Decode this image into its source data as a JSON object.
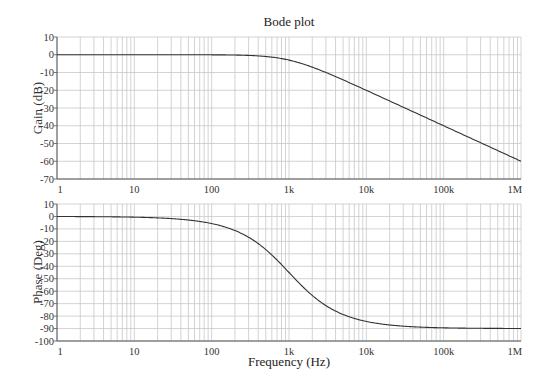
{
  "chart_data": [
    {
      "type": "line",
      "title": "Bode plot",
      "xlabel": "",
      "ylabel": "Gain (dB)",
      "xscale": "log",
      "xlim": [
        1,
        1000000
      ],
      "ylim": [
        -70,
        10
      ],
      "grid": true,
      "x_ticks": [
        "1",
        "10",
        "100",
        "1k",
        "10k",
        "100k",
        "1M"
      ],
      "y_ticks": [
        "10",
        "0",
        "-10",
        "-20",
        "-30",
        "-40",
        "-50",
        "-60",
        "-70"
      ],
      "series": [
        {
          "name": "Gain",
          "x": [
            1,
            10,
            100,
            300,
            1000,
            3000,
            10000,
            100000,
            1000000
          ],
          "y": [
            0,
            0,
            -0.04,
            -0.37,
            -3.01,
            -10.0,
            -20.04,
            -40.0,
            -60.0
          ]
        }
      ]
    },
    {
      "type": "line",
      "title": "",
      "xlabel": "Frequency (Hz)",
      "ylabel": "Phase (Deg)",
      "xscale": "log",
      "xlim": [
        1,
        1000000
      ],
      "ylim": [
        -100,
        10
      ],
      "grid": true,
      "x_ticks": [
        "1",
        "10",
        "100",
        "1k",
        "10k",
        "100k",
        "1M"
      ],
      "y_ticks": [
        "10",
        "0",
        "-10",
        "-20",
        "-30",
        "-40",
        "-50",
        "-60",
        "-70",
        "-80",
        "-90",
        "-100"
      ],
      "series": [
        {
          "name": "Phase",
          "x": [
            1,
            10,
            100,
            300,
            1000,
            3000,
            10000,
            100000,
            1000000
          ],
          "y": [
            -0.06,
            -0.57,
            -5.71,
            -16.7,
            -45.0,
            -71.6,
            -84.3,
            -89.4,
            -89.9
          ]
        }
      ]
    }
  ],
  "figure": {
    "title": "Bode plot",
    "xlabel": "Frequency (Hz)",
    "gain_ylabel": "Gain (dB)",
    "phase_ylabel": "Phase (Deg)",
    "corner_frequency_hz": 1000
  },
  "colors": {
    "curve": "#333333",
    "grid": "#c8c8c8",
    "axis": "#555555"
  }
}
